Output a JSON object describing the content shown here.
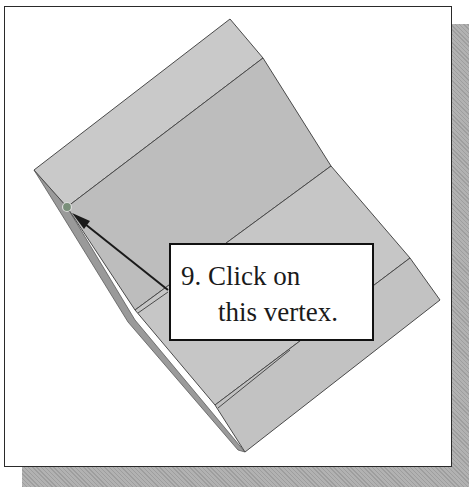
{
  "figure": {
    "callout": {
      "line1": "9. Click on",
      "line2": "this vertex."
    },
    "colors": {
      "face": "#c4c4c4",
      "face_dark": "#a9a9a9",
      "edge": "#4a4a4a",
      "frame_border": "#2a2a2a",
      "shadow": "#a8a8a8",
      "arrow": "#1a1a1a",
      "vertex_marker": "#6e8a6e"
    }
  }
}
